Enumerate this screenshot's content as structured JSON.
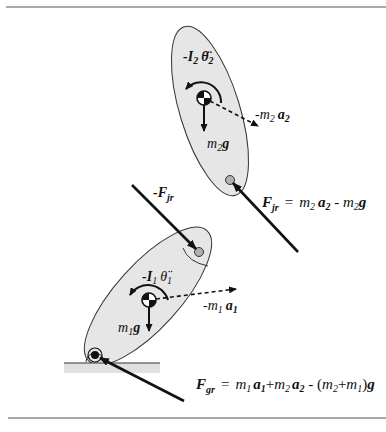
{
  "figure": {
    "type": "free-body diagram",
    "segments": [
      {
        "id": "segment-2",
        "inertia_label": "-I₂ θ̈₂",
        "gravity_label": "m₂g",
        "inertial_force_label": "-m₂a₂"
      },
      {
        "id": "segment-1",
        "inertia_label": "-I₁ θ̈₁",
        "gravity_label": "m₁g",
        "inertial_force_label": "-m₁a₁"
      }
    ],
    "joint_force_label": "-F",
    "joint_force_sub": "jr",
    "equations": {
      "joint_reaction": {
        "lhs": "F",
        "lhs_sub": "jr",
        "rhs": "= m₂a₂ - m₂g"
      },
      "ground_reaction": {
        "lhs": "F",
        "lhs_sub": "gr",
        "rhs": "= m₁a₁+m₂a₂ - (m₂+m₁)g"
      }
    },
    "colors": {
      "segment_fill": "#e6e6e6",
      "ground_fill": "#e0e0e0",
      "line": "#111111",
      "rule": "#555555"
    }
  }
}
